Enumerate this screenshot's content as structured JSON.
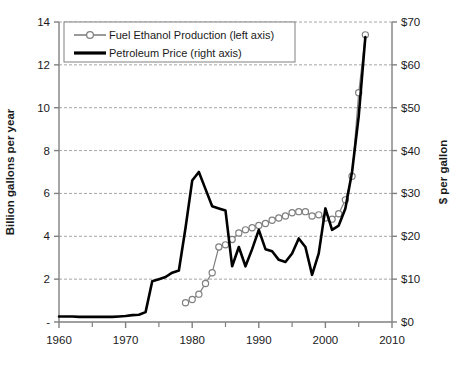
{
  "chart_data": {
    "type": "line",
    "title": "",
    "xlabel": "",
    "ylabel": "Billion gallons per year",
    "y2label": "$ per gallon",
    "xlim": [
      1960,
      2010
    ],
    "ylim": [
      0,
      14
    ],
    "y2lim": [
      0,
      70
    ],
    "grid": true,
    "grid_axis": "y",
    "legend_position": "top-left",
    "x_ticks": [
      1960,
      1970,
      1980,
      1990,
      2000,
      2010
    ],
    "x_tick_labels": [
      "1960",
      "1970",
      "1980",
      "1990",
      "2000",
      "2010"
    ],
    "x_minor_ticks": [
      1965,
      1975,
      1985,
      1995,
      2005
    ],
    "y_ticks": [
      0,
      2,
      4,
      6,
      8,
      10,
      12,
      14
    ],
    "y_tick_labels": [
      "-",
      "2",
      "4",
      "6",
      "8",
      "10",
      "12",
      "14"
    ],
    "y2_ticks": [
      0,
      10,
      20,
      30,
      40,
      50,
      60,
      70
    ],
    "y2_tick_labels": [
      "$0",
      "$10",
      "$20",
      "$30",
      "$40",
      "$50",
      "$60",
      "$70"
    ],
    "series": [
      {
        "name": "Fuel Ethanol Production (left axis)",
        "axis": "left",
        "units": "billion gallons per year",
        "marker": "open-circle",
        "color": "#808080",
        "line_width": 1.2,
        "x": [
          1979,
          1980,
          1981,
          1982,
          1983,
          1984,
          1985,
          1986,
          1987,
          1988,
          1989,
          1990,
          1991,
          1992,
          1993,
          1994,
          1995,
          1996,
          1997,
          1998,
          1999,
          2000,
          2001,
          2002,
          2003,
          2004,
          2005,
          2006
        ],
        "values": [
          0.9,
          1.05,
          1.3,
          1.8,
          2.3,
          3.5,
          3.6,
          3.85,
          4.15,
          4.3,
          4.4,
          4.5,
          4.6,
          4.75,
          4.85,
          4.95,
          5.1,
          5.15,
          5.15,
          4.95,
          5.0,
          4.85,
          4.8,
          5.05,
          5.7,
          6.8,
          10.7,
          13.4
        ]
      },
      {
        "name": "Petroleum Price (right axis)",
        "axis": "right",
        "units": "$ per gallon",
        "marker": "none",
        "color": "#000000",
        "line_width": 2.6,
        "x": [
          1960,
          1961,
          1962,
          1963,
          1964,
          1965,
          1966,
          1967,
          1968,
          1969,
          1970,
          1971,
          1972,
          1973,
          1974,
          1975,
          1976,
          1977,
          1978,
          1979,
          1980,
          1981,
          1982,
          1983,
          1984,
          1985,
          1986,
          1987,
          1988,
          1989,
          1990,
          1991,
          1992,
          1993,
          1994,
          1995,
          1996,
          1997,
          1998,
          1999,
          2000,
          2001,
          2002,
          2003,
          2004,
          2005,
          2006
        ],
        "values": [
          1.3,
          1.3,
          1.3,
          1.2,
          1.2,
          1.2,
          1.2,
          1.2,
          1.2,
          1.3,
          1.4,
          1.6,
          1.7,
          2.3,
          9.5,
          10.0,
          10.5,
          11.5,
          12.0,
          22.0,
          33.0,
          35.0,
          31.0,
          27.0,
          26.5,
          26.0,
          13.0,
          17.5,
          13.0,
          17.0,
          21.5,
          17.0,
          16.5,
          14.5,
          14.0,
          16.0,
          19.5,
          17.5,
          11.0,
          16.0,
          26.5,
          21.5,
          22.5,
          26.5,
          35.0,
          48.0,
          66.5
        ]
      }
    ]
  }
}
